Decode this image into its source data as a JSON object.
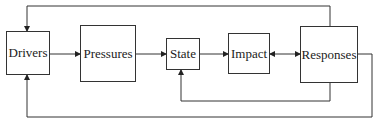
{
  "diagram": {
    "type": "DPSIR framework flow",
    "nodes": [
      {
        "id": "drivers",
        "label": "Drivers"
      },
      {
        "id": "pressures",
        "label": "Pressures"
      },
      {
        "id": "state",
        "label": "State"
      },
      {
        "id": "impact",
        "label": "Impact"
      },
      {
        "id": "responses",
        "label": "Responses"
      }
    ],
    "edges": [
      {
        "from": "drivers",
        "to": "pressures"
      },
      {
        "from": "pressures",
        "to": "state"
      },
      {
        "from": "state",
        "to": "impact"
      },
      {
        "from": "impact",
        "to": "responses",
        "bidirectional": true
      },
      {
        "from": "responses",
        "to": "drivers",
        "route": "top"
      },
      {
        "from": "responses",
        "to": "state",
        "route": "bottom-inner"
      },
      {
        "from": "responses",
        "to": "drivers",
        "route": "bottom-outer"
      }
    ],
    "colors": {
      "line": "#333333",
      "background": "#ffffff",
      "text": "#222222"
    }
  }
}
